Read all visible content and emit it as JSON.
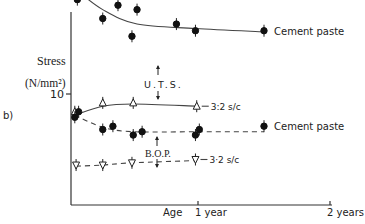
{
  "chart_data": {
    "type": "line",
    "panel_label": "b)",
    "title": "",
    "ylabel": "Stress",
    "ylabel_units": "(N/mm²)",
    "xlabel": "Age",
    "y_ticks": [
      {
        "value": 10,
        "label": "10"
      }
    ],
    "x_ticks": [
      {
        "value": 1,
        "label": "1 year"
      },
      {
        "value": 2,
        "label": "2 years"
      }
    ],
    "xlim": [
      0,
      2
    ],
    "ylim": [
      0,
      20
    ],
    "grid": false,
    "annotations": [
      {
        "text": "U.T.S.",
        "x": 0.8,
        "y": 13.5
      },
      {
        "text": "B.O.P.",
        "x": 0.8,
        "y": 5.5
      }
    ],
    "series": [
      {
        "name": "Cement paste",
        "group": "U.T.S.",
        "marker": "filled-circle",
        "line": "solid",
        "label": "Cement paste",
        "points": [
          {
            "x": 0.05,
            "y": 20.2
          },
          {
            "x": 0.05,
            "y": 18.5
          },
          {
            "x": 0.25,
            "y": 16.8
          },
          {
            "x": 0.37,
            "y": 18.0
          },
          {
            "x": 0.48,
            "y": 15.2
          },
          {
            "x": 0.52,
            "y": 17.6
          },
          {
            "x": 0.83,
            "y": 16.3
          },
          {
            "x": 0.98,
            "y": 15.7
          },
          {
            "x": 1.5,
            "y": 15.7
          }
        ],
        "fit": [
          {
            "x": 0.04,
            "y": 19.4
          },
          {
            "x": 0.25,
            "y": 17.6
          },
          {
            "x": 0.52,
            "y": 16.3
          },
          {
            "x": 0.98,
            "y": 15.9
          },
          {
            "x": 1.5,
            "y": 15.6
          }
        ]
      },
      {
        "name": "3:2 s/c",
        "group": "U.T.S.",
        "marker": "open-triangle",
        "line": "solid",
        "label": "3:2 s/c",
        "points": [
          {
            "x": 0.03,
            "y": 8.4
          },
          {
            "x": 0.25,
            "y": 9.2
          },
          {
            "x": 0.49,
            "y": 9.2
          },
          {
            "x": 0.99,
            "y": 8.9
          }
        ],
        "fit": [
          {
            "x": 0.03,
            "y": 8.1
          },
          {
            "x": 0.25,
            "y": 8.9
          },
          {
            "x": 0.49,
            "y": 9.1
          },
          {
            "x": 0.99,
            "y": 8.9
          }
        ]
      },
      {
        "name": "Cement paste",
        "group": "B.O.P.",
        "marker": "filled-circle",
        "line": "dashed",
        "label": "Cement paste",
        "points": [
          {
            "x": 0.03,
            "y": 7.9
          },
          {
            "x": 0.06,
            "y": 8.4
          },
          {
            "x": 0.25,
            "y": 6.8
          },
          {
            "x": 0.33,
            "y": 7.1
          },
          {
            "x": 0.49,
            "y": 6.3
          },
          {
            "x": 0.56,
            "y": 6.6
          },
          {
            "x": 0.98,
            "y": 6.3
          },
          {
            "x": 1.01,
            "y": 6.8
          },
          {
            "x": 1.5,
            "y": 7.1
          }
        ],
        "fit": [
          {
            "x": 0.03,
            "y": 8.1
          },
          {
            "x": 0.25,
            "y": 7.0
          },
          {
            "x": 0.49,
            "y": 6.6
          },
          {
            "x": 0.98,
            "y": 6.6
          },
          {
            "x": 1.5,
            "y": 6.6
          }
        ]
      },
      {
        "name": "3:2 s/c",
        "group": "B.O.P.",
        "marker": "open-triangle-down",
        "line": "dashed",
        "label": "3·2  s/c",
        "points": [
          {
            "x": 0.04,
            "y": 3.6
          },
          {
            "x": 0.25,
            "y": 3.6
          },
          {
            "x": 0.48,
            "y": 3.8
          },
          {
            "x": 0.98,
            "y": 4.1
          }
        ],
        "fit": [
          {
            "x": 0.04,
            "y": 3.5
          },
          {
            "x": 0.25,
            "y": 3.6
          },
          {
            "x": 0.48,
            "y": 3.8
          },
          {
            "x": 0.98,
            "y": 4.0
          }
        ]
      }
    ]
  }
}
